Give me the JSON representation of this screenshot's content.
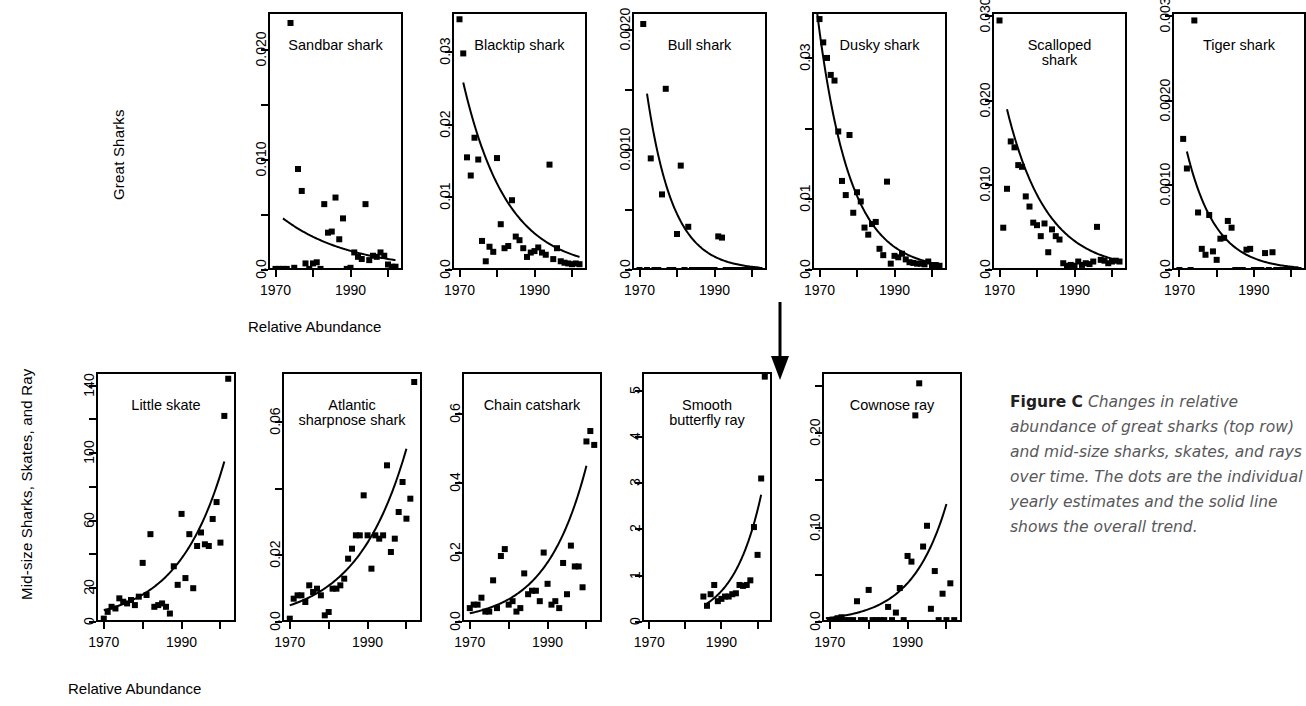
{
  "figure": {
    "caption_label": "Figure C",
    "caption_text": "Changes in relative abundance of great sharks (top row) and mid-size sharks, skates, and rays over time. The dots are the individual yearly estimates and the solid line shows the overall trend."
  },
  "rows": {
    "top": {
      "group_label": "Great Sharks",
      "xlabel": "Relative Abundance"
    },
    "bottom": {
      "group_label": "Mid-size Sharks, Skates, and Ray",
      "xlabel": "Relative Abundance"
    }
  },
  "axes": {
    "xticks": [
      "1970",
      "1990"
    ]
  },
  "chart_data": [
    {
      "id": "sandbar-shark",
      "type": "scatter",
      "title": "Sandbar shark",
      "row": "top",
      "xlabel": "",
      "ylabel": "",
      "xlim": [
        1968,
        2004
      ],
      "ylim": [
        0.0,
        0.0235
      ],
      "xticks": [
        1970,
        1990
      ],
      "xticklabels": [
        "1970",
        "1990"
      ],
      "yticks": [
        0.0,
        0.005,
        0.01,
        0.015,
        0.02
      ],
      "yticklabels": [
        "0.0",
        "",
        "0.010",
        "",
        "0.020"
      ],
      "x": [
        1970,
        1971,
        1972,
        1973,
        1974,
        1975,
        1976,
        1977,
        1978,
        1979,
        1980,
        1981,
        1982,
        1983,
        1984,
        1985,
        1986,
        1987,
        1988,
        1989,
        1990,
        1991,
        1992,
        1993,
        1994,
        1995,
        1996,
        1997,
        1998,
        1999,
        2000,
        2001,
        2002
      ],
      "y": [
        0.0001,
        0.0001,
        0.0001,
        0.0001,
        0.0225,
        0.0002,
        0.0092,
        0.0072,
        0.0006,
        0.0001,
        0.0006,
        0.0007,
        0.0001,
        0.006,
        0.0034,
        0.0035,
        0.0066,
        0.0028,
        0.0047,
        0.0001,
        0.0002,
        0.0016,
        0.0012,
        0.001,
        0.006,
        0.0009,
        0.0013,
        0.0012,
        0.0016,
        0.0013,
        0.0005,
        0.0003,
        0.0003
      ],
      "trend": {
        "model": "exponential",
        "y0": 0.0047,
        "x0": 1972,
        "x1": 2002,
        "y1": 0.0009
      }
    },
    {
      "id": "blacktip-shark",
      "type": "scatter",
      "title": "Blacktip shark",
      "row": "top",
      "xlim": [
        1968,
        2004
      ],
      "ylim": [
        0.0,
        0.0355
      ],
      "xticks": [
        1970,
        1990
      ],
      "xticklabels": [
        "1970",
        "1990"
      ],
      "yticks": [
        0.0,
        0.01,
        0.02,
        0.03
      ],
      "yticklabels": [
        "0.0",
        "0.01",
        "0.02",
        "0.03"
      ],
      "x": [
        1970,
        1971,
        1972,
        1973,
        1974,
        1975,
        1976,
        1977,
        1978,
        1979,
        1980,
        1981,
        1982,
        1983,
        1984,
        1985,
        1986,
        1987,
        1988,
        1989,
        1990,
        1991,
        1992,
        1993,
        1994,
        1995,
        1996,
        1997,
        1998,
        1999,
        2000,
        2001,
        2002
      ],
      "y": [
        0.0345,
        0.0298,
        0.0155,
        0.013,
        0.0182,
        0.0152,
        0.004,
        0.0012,
        0.0032,
        0.0025,
        0.0154,
        0.0063,
        0.003,
        0.0033,
        0.0096,
        0.0046,
        0.0041,
        0.003,
        0.0018,
        0.0024,
        0.0026,
        0.0031,
        0.0024,
        0.0021,
        0.0145,
        0.0015,
        0.003,
        0.0012,
        0.001,
        0.0009,
        0.0008,
        0.0009,
        0.0008
      ],
      "trend": {
        "model": "exponential",
        "y0": 0.0258,
        "x0": 1971,
        "x1": 2002,
        "y1": 0.0018
      }
    },
    {
      "id": "bull-shark",
      "type": "scatter",
      "title": "Bull shark",
      "row": "top",
      "xlim": [
        1968,
        2004
      ],
      "ylim": [
        0.0,
        0.00215
      ],
      "xticks": [
        1970,
        1990
      ],
      "xticklabels": [
        "1970",
        "1990"
      ],
      "yticks": [
        0.0,
        0.0005,
        0.001,
        0.0015,
        0.002
      ],
      "yticklabels": [
        "0.0",
        "",
        "0.0010",
        "",
        "0.0020"
      ],
      "x": [
        1970,
        1971,
        1972,
        1973,
        1974,
        1975,
        1976,
        1977,
        1978,
        1979,
        1980,
        1981,
        1982,
        1983,
        1984,
        1985,
        1986,
        1987,
        1988,
        1989,
        1990,
        1991,
        1992,
        1993,
        1994,
        1995,
        1996,
        1997,
        1998,
        1999,
        2000,
        2001,
        2002
      ],
      "y": [
        0.0,
        0.00205,
        0.0,
        0.00093,
        0.0,
        0.0,
        0.00063,
        0.00151,
        0.0,
        0.0,
        0.0003,
        0.00087,
        0.0,
        0.00036,
        0.0,
        0.0,
        0.0,
        0.0,
        0.0,
        0.0,
        0.0,
        0.00028,
        0.00027,
        0.0,
        0.0,
        0.0,
        0.0,
        0.0,
        0.0,
        0.0,
        0.0,
        0.0,
        0.0
      ],
      "trend": {
        "model": "exponential",
        "y0": 0.00147,
        "x0": 1972,
        "x1": 2002,
        "y1": 2e-05
      }
    },
    {
      "id": "dusky-shark",
      "type": "scatter",
      "title": "Dusky shark",
      "row": "top",
      "xlim": [
        1968,
        2004
      ],
      "ylim": [
        0.0,
        0.0365
      ],
      "xticks": [
        1970,
        1990
      ],
      "xticklabels": [
        "1970",
        "1990"
      ],
      "yticks": [
        0.0,
        0.01,
        0.02,
        0.03
      ],
      "yticklabels": [
        "0.0",
        "0.01",
        "",
        "0.03"
      ],
      "x": [
        1970,
        1971,
        1972,
        1973,
        1974,
        1975,
        1976,
        1977,
        1978,
        1979,
        1980,
        1981,
        1982,
        1983,
        1984,
        1985,
        1986,
        1987,
        1988,
        1989,
        1990,
        1991,
        1992,
        1993,
        1994,
        1995,
        1996,
        1997,
        1998,
        1999,
        2000,
        2001,
        2002
      ],
      "y": [
        0.0355,
        0.0322,
        0.03,
        0.0276,
        0.0268,
        0.0196,
        0.0126,
        0.0106,
        0.0191,
        0.0081,
        0.011,
        0.0097,
        0.006,
        0.005,
        0.0065,
        0.0068,
        0.003,
        0.0021,
        0.0125,
        0.0009,
        0.002,
        0.0018,
        0.0023,
        0.0015,
        0.0011,
        0.001,
        0.0009,
        0.0009,
        0.0008,
        0.0012,
        0.0007,
        0.0007,
        0.0006
      ],
      "trend": {
        "model": "exponential",
        "y0": 0.038,
        "x0": 1969,
        "x1": 2002,
        "y1": 0.0008
      }
    },
    {
      "id": "scalloped-shark",
      "type": "scatter",
      "title": "Scalloped\nshark",
      "row": "top",
      "xlim": [
        1968,
        2004
      ],
      "ylim": [
        0.0,
        0.0305
      ],
      "xticks": [
        1970,
        1990
      ],
      "xticklabels": [
        "1970",
        "1990"
      ],
      "yticks": [
        0.0,
        0.01,
        0.02,
        0.03
      ],
      "yticklabels": [
        "0.0",
        "0.010",
        "0.020",
        "0.030"
      ],
      "x": [
        1970,
        1971,
        1972,
        1973,
        1974,
        1975,
        1976,
        1977,
        1978,
        1979,
        1980,
        1981,
        1982,
        1983,
        1984,
        1985,
        1986,
        1987,
        1988,
        1989,
        1990,
        1991,
        1992,
        1993,
        1994,
        1995,
        1996,
        1997,
        1998,
        1999,
        2000,
        2001,
        2002
      ],
      "y": [
        0.0295,
        0.005,
        0.0096,
        0.0152,
        0.0145,
        0.0124,
        0.0122,
        0.0087,
        0.0075,
        0.0056,
        0.0053,
        0.004,
        0.0055,
        0.0021,
        0.0048,
        0.004,
        0.0036,
        0.0008,
        0.0005,
        0.0006,
        0.0005,
        0.001,
        0.0006,
        0.0008,
        0.0007,
        0.001,
        0.0051,
        0.0012,
        0.0011,
        0.0008,
        0.001,
        0.0011,
        0.001
      ],
      "trend": {
        "model": "exponential",
        "y0": 0.019,
        "x0": 1972,
        "x1": 2002,
        "y1": 0.0011
      }
    },
    {
      "id": "tiger-shark",
      "type": "scatter",
      "title": "Tiger shark",
      "row": "top",
      "xlim": [
        1968,
        2004
      ],
      "ylim": [
        0.0,
        0.00305
      ],
      "xticks": [
        1970,
        1990
      ],
      "xticklabels": [
        "1970",
        "1990"
      ],
      "yticks": [
        0.0,
        0.001,
        0.002,
        0.003
      ],
      "yticklabels": [
        "0.0",
        "0.0010",
        "0.0020",
        "0.003"
      ],
      "x": [
        1970,
        1971,
        1972,
        1973,
        1974,
        1975,
        1976,
        1977,
        1978,
        1979,
        1980,
        1981,
        1982,
        1983,
        1984,
        1985,
        1986,
        1987,
        1988,
        1989,
        1990,
        1991,
        1992,
        1993,
        1994,
        1995,
        1996,
        1997,
        1998,
        1999,
        2000,
        2001,
        2002
      ],
      "y": [
        0.0,
        0.00155,
        0.0012,
        0.0,
        0.00295,
        0.00068,
        0.00025,
        0.00018,
        0.00065,
        0.00022,
        0.00012,
        0.00037,
        0.00038,
        0.00058,
        0.0005,
        0.0,
        0.0,
        0.0,
        0.00024,
        0.00025,
        0.0,
        0.0,
        0.0,
        0.0002,
        0.0,
        0.00021,
        0.0,
        0.0,
        0.0,
        0.0,
        0.0,
        0.0,
        0.0
      ],
      "trend": {
        "model": "exponential",
        "y0": 0.0014,
        "x0": 1972,
        "x1": 2002,
        "y1": 3e-05
      }
    },
    {
      "id": "little-skate",
      "type": "scatter",
      "title": "Little skate",
      "row": "bottom",
      "xlim": [
        1968,
        2004
      ],
      "ylim": [
        0,
        148
      ],
      "xticks": [
        1970,
        1990
      ],
      "xticklabels": [
        "1970",
        "1990"
      ],
      "yticks": [
        0,
        20,
        40,
        60,
        80,
        100,
        120,
        140
      ],
      "yticklabels": [
        "0",
        "20",
        "",
        "60",
        "",
        "100",
        "",
        "140"
      ],
      "x": [
        1970,
        1971,
        1972,
        1973,
        1974,
        1975,
        1976,
        1977,
        1978,
        1979,
        1980,
        1981,
        1982,
        1983,
        1984,
        1985,
        1986,
        1987,
        1988,
        1989,
        1990,
        1991,
        1992,
        1993,
        1994,
        1995,
        1996,
        1997,
        1998,
        1999,
        2000,
        2001,
        2002
      ],
      "y": [
        2,
        6,
        9,
        8,
        14,
        12,
        11,
        13,
        10,
        15,
        35,
        16,
        52,
        9,
        10,
        11,
        9,
        5,
        33,
        22,
        64,
        26,
        52,
        20,
        45,
        53,
        46,
        45,
        61,
        71,
        47,
        122,
        144
      ],
      "trend": {
        "model": "exponential",
        "y0": 7,
        "x0": 1970,
        "x1": 2001,
        "y1": 95
      }
    },
    {
      "id": "atlantic-sharpnose-shark",
      "type": "scatter",
      "title": "Atlantic\nsharpnose shark",
      "row": "bottom",
      "xlim": [
        1968,
        2004
      ],
      "ylim": [
        0.0,
        0.075
      ],
      "xticks": [
        1970,
        1990
      ],
      "xticklabels": [
        "1970",
        "1990"
      ],
      "yticks": [
        0.0,
        0.02,
        0.04,
        0.06
      ],
      "yticklabels": [
        "0.0",
        "0.02",
        "",
        "0.06"
      ],
      "x": [
        1970,
        1971,
        1972,
        1973,
        1974,
        1975,
        1976,
        1977,
        1978,
        1979,
        1980,
        1981,
        1982,
        1983,
        1984,
        1985,
        1986,
        1987,
        1988,
        1989,
        1990,
        1991,
        1992,
        1993,
        1994,
        1995,
        1996,
        1997,
        1998,
        1999,
        2000,
        2001,
        2002
      ],
      "y": [
        0.001,
        0.007,
        0.008,
        0.008,
        0.006,
        0.011,
        0.009,
        0.01,
        0.008,
        0.002,
        0.003,
        0.01,
        0.01,
        0.011,
        0.013,
        0.019,
        0.022,
        0.026,
        0.026,
        0.038,
        0.026,
        0.016,
        0.026,
        0.025,
        0.026,
        0.047,
        0.021,
        0.025,
        0.033,
        0.042,
        0.031,
        0.037,
        0.072
      ],
      "trend": {
        "model": "exponential",
        "y0": 0.005,
        "x0": 1970,
        "x1": 2000,
        "y1": 0.052
      }
    },
    {
      "id": "chain-catshark",
      "type": "scatter",
      "title": "Chain catshark",
      "row": "bottom",
      "xlim": [
        1968,
        2004
      ],
      "ylim": [
        0.0,
        0.72
      ],
      "xticks": [
        1970,
        1990
      ],
      "xticklabels": [
        "1970",
        "1990"
      ],
      "yticks": [
        0.0,
        0.2,
        0.4,
        0.6
      ],
      "yticklabels": [
        "0.0",
        "0.2",
        "0.4",
        "0.6"
      ],
      "x": [
        1970,
        1971,
        1972,
        1973,
        1974,
        1975,
        1976,
        1977,
        1978,
        1979,
        1980,
        1981,
        1982,
        1983,
        1984,
        1985,
        1986,
        1987,
        1988,
        1989,
        1990,
        1991,
        1992,
        1993,
        1994,
        1995,
        1996,
        1997,
        1998,
        1999,
        2000,
        2001,
        2002
      ],
      "y": [
        0.04,
        0.05,
        0.05,
        0.07,
        0.03,
        0.03,
        0.12,
        0.04,
        0.19,
        0.21,
        0.05,
        0.06,
        0.03,
        0.04,
        0.14,
        0.08,
        0.09,
        0.09,
        0.06,
        0.2,
        0.11,
        0.05,
        0.06,
        0.04,
        0.17,
        0.08,
        0.22,
        0.16,
        0.16,
        0.1,
        0.52,
        0.55,
        0.51
      ],
      "trend": {
        "model": "exponential",
        "y0": 0.025,
        "x0": 1970,
        "x1": 2000,
        "y1": 0.45
      }
    },
    {
      "id": "smooth-butterfly-ray",
      "type": "scatter",
      "title": "Smooth\nbutterfly ray",
      "row": "bottom",
      "xlim": [
        1968,
        2004
      ],
      "ylim": [
        0,
        5.4
      ],
      "xticks": [
        1970,
        1990
      ],
      "xticklabels": [
        "1970",
        "1990"
      ],
      "yticks": [
        0,
        1,
        2,
        3,
        4,
        5
      ],
      "yticklabels": [
        "0",
        "1",
        "2",
        "3",
        "4",
        "5"
      ],
      "x": [
        1985,
        1986,
        1987,
        1988,
        1989,
        1990,
        1991,
        1992,
        1993,
        1994,
        1995,
        1996,
        1997,
        1998,
        1999,
        2000,
        2001,
        2002
      ],
      "y": [
        0.55,
        0.35,
        0.6,
        0.8,
        0.45,
        0.5,
        0.55,
        0.55,
        0.6,
        0.62,
        0.8,
        0.78,
        0.8,
        0.9,
        2.05,
        1.45,
        3.1,
        5.3
      ],
      "trend": {
        "model": "exponential",
        "y0": 0.4,
        "x0": 1986,
        "x1": 2001,
        "y1": 2.75
      }
    },
    {
      "id": "cownose-ray",
      "type": "scatter",
      "title": "Cownose ray",
      "row": "bottom",
      "xlim": [
        1968,
        2004
      ],
      "ylim": [
        0.0,
        0.265
      ],
      "xticks": [
        1970,
        1990
      ],
      "xticklabels": [
        "1970",
        "1990"
      ],
      "yticks": [
        0.0,
        0.05,
        0.1,
        0.15,
        0.2,
        0.25
      ],
      "yticklabels": [
        "0.0",
        "",
        "0.10",
        "",
        "0.20",
        ""
      ],
      "x": [
        1970,
        1971,
        1972,
        1973,
        1974,
        1975,
        1976,
        1977,
        1978,
        1979,
        1980,
        1981,
        1982,
        1983,
        1984,
        1985,
        1986,
        1987,
        1988,
        1989,
        1990,
        1991,
        1992,
        1993,
        1994,
        1995,
        1996,
        1997,
        1998,
        1999,
        2000,
        2001,
        2002
      ],
      "y": [
        0.002,
        0.002,
        0.004,
        0.005,
        0.002,
        0.002,
        0.002,
        0.022,
        0.002,
        0.002,
        0.034,
        0.002,
        0.002,
        0.002,
        0.002,
        0.016,
        0.002,
        0.01,
        0.036,
        0.002,
        0.07,
        0.064,
        0.219,
        0.253,
        0.08,
        0.102,
        0.014,
        0.054,
        0.002,
        0.03,
        0.002,
        0.041,
        0.002
      ],
      "trend": {
        "model": "exponential",
        "y0": 0.004,
        "x0": 1969,
        "x1": 2000,
        "y1": 0.125
      }
    }
  ]
}
